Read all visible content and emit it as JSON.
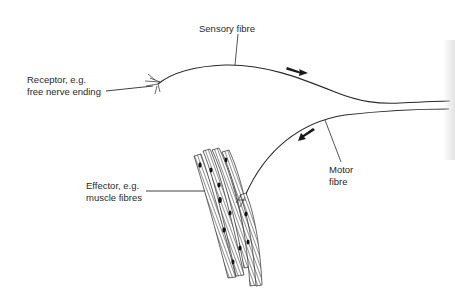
{
  "diagram": {
    "labels": {
      "sensory": "Sensory fibre",
      "receptor_line1": "Receptor, e.g.",
      "receptor_line2": "free nerve ending",
      "motor_line1": "Motor",
      "motor_line2": "fibre",
      "effector_line1": "Effector, e.g.",
      "effector_line2": "muscle fibres"
    },
    "arrows": {
      "sensory_direction": "right (towards spinal cord)",
      "motor_direction": "down-left (towards effector)"
    },
    "colors": {
      "line": "#2a2a2a",
      "background": "#ffffff"
    }
  }
}
